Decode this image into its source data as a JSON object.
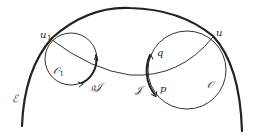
{
  "figure": {
    "stroke_color": "#222222",
    "background": "#ffffff",
    "labels": {
      "u1": {
        "main": "u",
        "sub": "1"
      },
      "u": "u",
      "O1": {
        "main": "𝒪",
        "sub": "1"
      },
      "O": "𝒪",
      "E": "ℰ",
      "gJ": "𝔤𝒥",
      "J": "𝒥",
      "q": "q",
      "p": "p"
    }
  }
}
